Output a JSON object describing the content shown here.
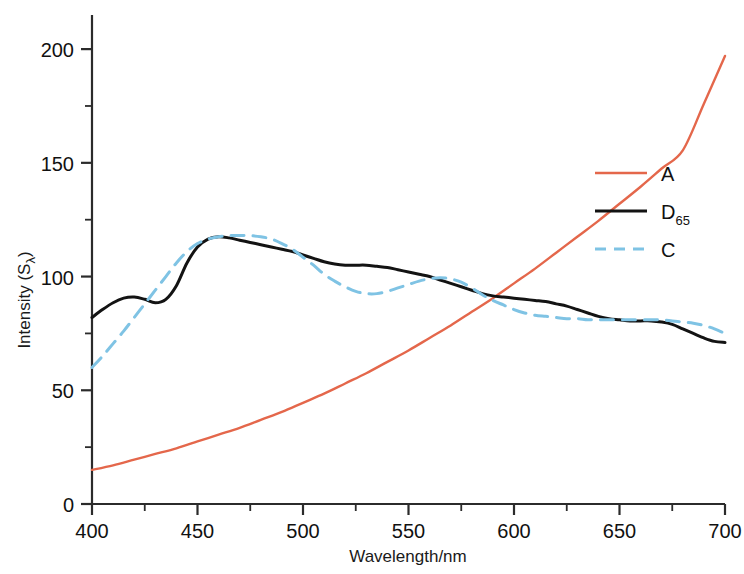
{
  "chart_data": {
    "type": "line",
    "title": "",
    "xlabel": "Wavelength/nm",
    "ylabel": "Intensity (Sλ)",
    "ylabel_main": "Intensity (S",
    "ylabel_sub": "λ",
    "ylabel_tail": ")",
    "xlim": [
      400,
      700
    ],
    "ylim": [
      0,
      215
    ],
    "grid": false,
    "legend_position": "right",
    "xticks": [
      400,
      450,
      500,
      550,
      600,
      650,
      700
    ],
    "xtick_labels": [
      "400",
      "450",
      "500",
      "550",
      "600",
      "650",
      "700"
    ],
    "xminor_step": 25,
    "yticks": [
      0,
      50,
      100,
      150,
      200
    ],
    "ytick_labels": [
      "0",
      "50",
      "100",
      "150",
      "200"
    ],
    "yminor_step": 25,
    "series": [
      {
        "name": "A",
        "label": "A",
        "label_sub": "",
        "color": "#E4674B",
        "style": "solid",
        "width": 2.4,
        "x": [
          400,
          410,
          420,
          430,
          440,
          450,
          460,
          470,
          480,
          490,
          500,
          510,
          520,
          530,
          540,
          550,
          560,
          570,
          580,
          590,
          600,
          610,
          620,
          630,
          640,
          650,
          660,
          670,
          680,
          690,
          700
        ],
        "values": [
          15,
          17,
          19.5,
          22,
          24.5,
          27.5,
          30.5,
          33.5,
          37,
          40.5,
          44.5,
          48.5,
          53,
          57.5,
          62.5,
          67.5,
          73,
          78.5,
          84.5,
          90.5,
          97,
          103.5,
          110.5,
          117.5,
          124.5,
          132,
          139.5,
          147.5,
          155.5,
          176,
          197
        ]
      },
      {
        "name": "D65",
        "label": "D",
        "label_sub": "65",
        "color": "#131313",
        "style": "solid",
        "width": 3.0,
        "x": [
          400,
          405,
          410,
          415,
          420,
          425,
          430,
          435,
          440,
          445,
          450,
          455,
          460,
          465,
          470,
          475,
          480,
          485,
          490,
          495,
          500,
          505,
          510,
          515,
          520,
          525,
          530,
          535,
          540,
          545,
          550,
          555,
          560,
          565,
          570,
          575,
          580,
          585,
          590,
          595,
          600,
          605,
          610,
          615,
          620,
          625,
          630,
          635,
          640,
          645,
          650,
          655,
          660,
          665,
          670,
          675,
          680,
          685,
          690,
          695,
          700
        ],
        "values": [
          82,
          85.5,
          88.5,
          90.5,
          91,
          90,
          88.5,
          90,
          96,
          106,
          113,
          116.5,
          117.5,
          117,
          116,
          115,
          114,
          113,
          112,
          111,
          109.5,
          108,
          106.5,
          105.5,
          105,
          105,
          105,
          104.5,
          104,
          103,
          102,
          101,
          100,
          98.5,
          97,
          95.5,
          94,
          92.5,
          91.5,
          91,
          90.5,
          90,
          89.5,
          89,
          88,
          87,
          85.5,
          84,
          82.5,
          81.5,
          81,
          80.5,
          80.5,
          80.5,
          80,
          79,
          77,
          75,
          73,
          71.5,
          71
        ]
      },
      {
        "name": "C",
        "label": "C",
        "label_sub": "",
        "color": "#7FC3E4",
        "style": "dashed",
        "width": 3.0,
        "x": [
          400,
          405,
          410,
          415,
          420,
          425,
          430,
          435,
          440,
          445,
          450,
          455,
          460,
          465,
          470,
          475,
          480,
          485,
          490,
          495,
          500,
          505,
          510,
          515,
          520,
          525,
          530,
          535,
          540,
          545,
          550,
          555,
          560,
          565,
          570,
          575,
          580,
          585,
          590,
          595,
          600,
          605,
          610,
          615,
          620,
          625,
          630,
          635,
          640,
          645,
          650,
          655,
          660,
          665,
          670,
          675,
          680,
          685,
          690,
          695,
          700
        ],
        "values": [
          60,
          65,
          70.5,
          76,
          82,
          88,
          94,
          100,
          106,
          111,
          114.5,
          116.5,
          117.5,
          118,
          118,
          118,
          117.5,
          116.5,
          114.5,
          112,
          108.5,
          105,
          101,
          98,
          95.5,
          93.5,
          92.5,
          92.5,
          93.5,
          95,
          96.5,
          98,
          99,
          99.5,
          99,
          97.5,
          95,
          92,
          89.5,
          87.5,
          85.5,
          84,
          83,
          82.5,
          82,
          81.5,
          81.5,
          81,
          81,
          81,
          81,
          81,
          81,
          81,
          81,
          80.5,
          80,
          79.5,
          78.5,
          77,
          75
        ]
      }
    ]
  },
  "axes": {
    "x_axis_name": "x-axis",
    "y_axis_name": "y-axis"
  }
}
